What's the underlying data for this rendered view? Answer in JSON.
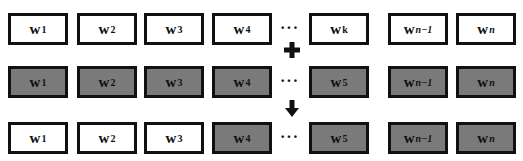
{
  "colors": {
    "white_box": "#ffffff",
    "gray_box": "#7a7a7a",
    "border": "#111111"
  },
  "ellipsis": "···",
  "operators": {
    "plus": "plus-icon",
    "arrow": "down-arrow-icon"
  },
  "rows": [
    {
      "name": "original-weights",
      "boxes": [
        {
          "base": "w",
          "sub": "1",
          "italic": false,
          "fill": "white"
        },
        {
          "base": "w",
          "sub": "2",
          "italic": false,
          "fill": "white"
        },
        {
          "base": "w",
          "sub": "3",
          "italic": false,
          "fill": "white"
        },
        {
          "base": "w",
          "sub": "4",
          "italic": false,
          "fill": "white"
        },
        {
          "base": "w",
          "sub": "k",
          "italic": false,
          "fill": "white"
        },
        {
          "base": "w",
          "sub": "n−1",
          "italic": true,
          "fill": "white"
        },
        {
          "base": "w",
          "sub": "n",
          "italic": true,
          "fill": "white"
        }
      ]
    },
    {
      "name": "new-weights",
      "boxes": [
        {
          "base": "w",
          "sub": "1",
          "italic": false,
          "fill": "gray"
        },
        {
          "base": "w",
          "sub": "2",
          "italic": false,
          "fill": "gray"
        },
        {
          "base": "w",
          "sub": "3",
          "italic": false,
          "fill": "gray"
        },
        {
          "base": "w",
          "sub": "4",
          "italic": false,
          "fill": "gray"
        },
        {
          "base": "w",
          "sub": "5",
          "italic": false,
          "fill": "gray"
        },
        {
          "base": "w",
          "sub": "n−1",
          "italic": true,
          "fill": "gray"
        },
        {
          "base": "w",
          "sub": "n",
          "italic": true,
          "fill": "gray"
        }
      ]
    },
    {
      "name": "merged-weights",
      "boxes": [
        {
          "base": "w",
          "sub": "1",
          "italic": false,
          "fill": "white"
        },
        {
          "base": "w",
          "sub": "2",
          "italic": false,
          "fill": "white"
        },
        {
          "base": "w",
          "sub": "3",
          "italic": false,
          "fill": "white"
        },
        {
          "base": "w",
          "sub": "4",
          "italic": false,
          "fill": "gray"
        },
        {
          "base": "w",
          "sub": "5",
          "italic": false,
          "fill": "gray"
        },
        {
          "base": "w",
          "sub": "n−1",
          "italic": true,
          "fill": "gray"
        },
        {
          "base": "w",
          "sub": "n",
          "italic": true,
          "fill": "gray"
        }
      ]
    }
  ]
}
